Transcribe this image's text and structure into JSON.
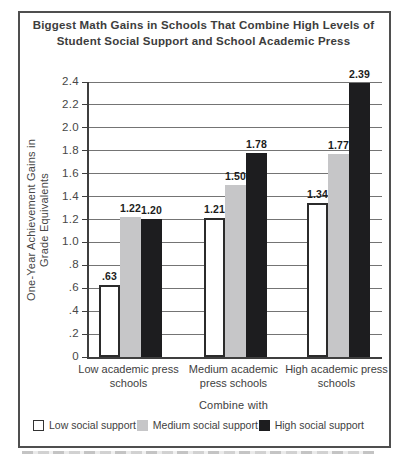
{
  "header": {
    "title_line1": "Biggest Math Gains in Schools That Combine High Levels of",
    "title_line2": "Student Social Support and School Academic Press"
  },
  "chart_data": {
    "type": "bar",
    "title": "Biggest Math Gains in Schools That Combine High Levels of Student Social Support and School Academic Press",
    "categories": [
      "Low academic press schools",
      "Medium academic press schools",
      "High academic press schools"
    ],
    "series": [
      {
        "name": "Low social support",
        "color": "#ffffff",
        "border_color": "#2b2b2b",
        "values": [
          0.63,
          1.21,
          1.34
        ],
        "value_labels": [
          ".63",
          "1.21",
          "1.34"
        ]
      },
      {
        "name": "Medium social support",
        "color": "#c6c6c8",
        "border_color": "#c6c6c8",
        "values": [
          1.22,
          1.5,
          1.77
        ],
        "value_labels": [
          "1.22",
          "1.50",
          "1.77"
        ]
      },
      {
        "name": "High social support",
        "color": "#1d1d1f",
        "border_color": "#1d1d1f",
        "values": [
          1.2,
          1.78,
          2.39
        ],
        "value_labels": [
          "1.20",
          "1.78",
          "2.39"
        ]
      }
    ],
    "xlabel": "Combine with",
    "ylabel": "One-Year Achievement Gains in Grade Equivalents",
    "ylabel_lines": [
      "One-Year Achievement Gains in",
      "Grade Equivalents"
    ],
    "ylim": [
      0,
      2.4
    ],
    "ytick_labels": [
      "0",
      ".2",
      ".4",
      ".6",
      ".8",
      "1.0",
      "1.2",
      "1.4",
      "1.6",
      "1.8",
      "2.0",
      "2.2",
      "2.4"
    ],
    "grid": true,
    "legend_position": "bottom",
    "colors": {
      "axis": "#3f3f3f",
      "grid": "#747474",
      "frame": "#4f4f4f",
      "text": "#3e3e3e"
    }
  }
}
